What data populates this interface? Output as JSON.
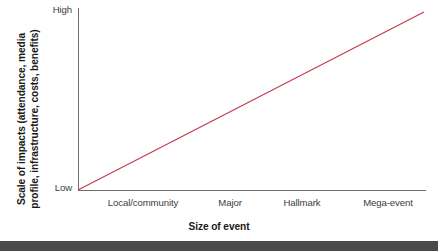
{
  "chart_data": {
    "type": "line",
    "title": "",
    "subtitle": "",
    "xlabel": "Size of event",
    "ylabel_lines": [
      "Scale of impacts (attendance, media",
      "profile, infrastructure, costs, benefits)"
    ],
    "ylabel": "Scale of impacts (attendance, media profile, infrastructure, costs, benefits)",
    "categories": [
      "Local/community",
      "Major",
      "Hallmark",
      "Mega-event"
    ],
    "x": [
      1,
      2,
      3,
      4
    ],
    "series": [
      {
        "name": "Scale of impacts",
        "values": [
          0,
          0.333,
          0.667,
          1.0
        ],
        "color": "#c8384f"
      }
    ],
    "ytick_labels": [
      "Low",
      "High"
    ],
    "ylim": [
      0,
      1
    ],
    "xlim": [
      0.5,
      4.5
    ],
    "grid": false,
    "legend": "none",
    "annotations": []
  },
  "axes": {
    "y_high_label": "High",
    "y_low_label": "Low",
    "axis_color": "#6e6e6e"
  },
  "colors": {
    "line": "#c8384f",
    "axis": "#6e6e6e",
    "text": "#3c3c3c",
    "title_text": "#1a1a1a",
    "background": "#ffffff",
    "footer_band": "#4a4a4d"
  }
}
